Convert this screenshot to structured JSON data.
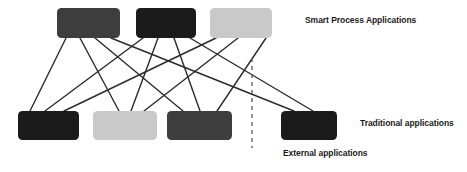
{
  "diagram": {
    "type": "bipartite-node-link",
    "canvas": {
      "width": 467,
      "height": 172,
      "background": "#ffffff"
    },
    "colors": {
      "dark_gray": "#3d3d3d",
      "near_black": "#1b1b1b",
      "light_gray": "#c9c9c9",
      "line": "#2b2b2b",
      "divider": "#555555",
      "text": "#1a1a1a"
    },
    "labels": {
      "smart_process": "Smart Process Applications",
      "traditional": "Traditional applications",
      "external": "External applications"
    },
    "divider": {
      "name": "external-applications-divider",
      "orientation": "vertical",
      "style": "dashed",
      "x": 252,
      "y1": 58,
      "y2": 148,
      "color": "#555555",
      "dash": "4 4",
      "width": 1.3
    },
    "top_row": {
      "group": "smart-process-applications",
      "y": 8,
      "height": 30,
      "nodes": [
        {
          "id": "spa-1",
          "name": "smart-process-app-1",
          "x": 57,
          "width": 63,
          "fill": "#3d3d3d",
          "shade": "dark-gray"
        },
        {
          "id": "spa-2",
          "name": "smart-process-app-2",
          "x": 136,
          "width": 60,
          "fill": "#1b1b1b",
          "shade": "near-black"
        },
        {
          "id": "spa-3",
          "name": "smart-process-app-3",
          "x": 210,
          "width": 62,
          "fill": "#c9c9c9",
          "shade": "light-gray"
        }
      ]
    },
    "bottom_row": {
      "group": "traditional-and-external-applications",
      "y": 111,
      "height": 29,
      "nodes": [
        {
          "id": "trad-1",
          "name": "traditional-app-1",
          "x": 18,
          "width": 61,
          "fill": "#1b1b1b",
          "shade": "near-black"
        },
        {
          "id": "trad-2",
          "name": "traditional-app-2",
          "x": 93,
          "width": 64,
          "fill": "#c9c9c9",
          "shade": "light-gray"
        },
        {
          "id": "trad-3",
          "name": "traditional-app-3",
          "x": 167,
          "width": 65,
          "fill": "#3d3d3d",
          "shade": "dark-gray"
        },
        {
          "id": "ext-1",
          "name": "external-app-1",
          "x": 281,
          "width": 56,
          "fill": "#1b1b1b",
          "shade": "near-black"
        }
      ]
    },
    "links": [
      {
        "name": "link-spa1-trad1",
        "from": "spa-1",
        "to": "trad-1",
        "x1": 66,
        "y1": 38,
        "x2": 30,
        "y2": 111
      },
      {
        "name": "link-spa1-trad2",
        "from": "spa-1",
        "to": "trad-2",
        "x1": 80,
        "y1": 38,
        "x2": 119,
        "y2": 111
      },
      {
        "name": "link-spa1-trad3",
        "from": "spa-1",
        "to": "trad-3",
        "x1": 95,
        "y1": 38,
        "x2": 183,
        "y2": 111
      },
      {
        "name": "link-spa1-ext1",
        "from": "spa-1",
        "to": "ext-1",
        "x1": 111,
        "y1": 38,
        "x2": 294,
        "y2": 111
      },
      {
        "name": "link-spa2-trad1",
        "from": "spa-2",
        "to": "trad-1",
        "x1": 143,
        "y1": 38,
        "x2": 45,
        "y2": 111
      },
      {
        "name": "link-spa2-trad2",
        "from": "spa-2",
        "to": "trad-2",
        "x1": 158,
        "y1": 38,
        "x2": 131,
        "y2": 111
      },
      {
        "name": "link-spa2-trad3",
        "from": "spa-2",
        "to": "trad-3",
        "x1": 174,
        "y1": 38,
        "x2": 200,
        "y2": 111
      },
      {
        "name": "link-spa2-ext1",
        "from": "spa-2",
        "to": "ext-1",
        "x1": 190,
        "y1": 38,
        "x2": 313,
        "y2": 111
      },
      {
        "name": "link-spa3-trad1",
        "from": "spa-3",
        "to": "trad-1",
        "x1": 216,
        "y1": 38,
        "x2": 64,
        "y2": 111
      },
      {
        "name": "link-spa3-trad2",
        "from": "spa-3",
        "to": "trad-2",
        "x1": 238,
        "y1": 38,
        "x2": 144,
        "y2": 111
      },
      {
        "name": "link-spa3-trad3",
        "from": "spa-3",
        "to": "trad-3",
        "x1": 266,
        "y1": 38,
        "x2": 217,
        "y2": 111
      }
    ]
  }
}
